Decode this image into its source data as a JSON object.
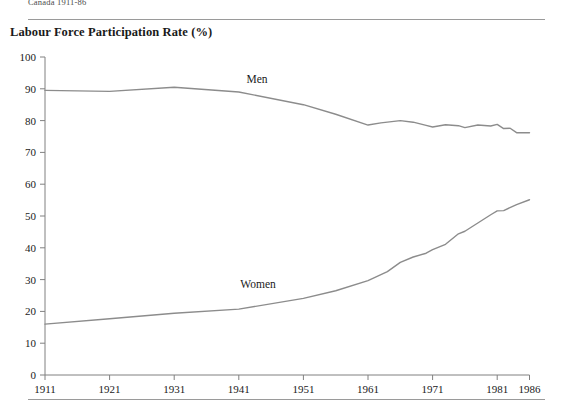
{
  "running_head": "Canada 1911-86",
  "chart_title": "Labour Force Participation Rate (%)",
  "labels": {
    "men": "Men",
    "women": "Women"
  },
  "chart_data": {
    "type": "line",
    "title": "Labour Force Participation Rate (%)",
    "xlabel": "",
    "ylabel": "",
    "xlim": [
      1911,
      1986
    ],
    "ylim": [
      0,
      100
    ],
    "grid": false,
    "legend": "inline-annotations",
    "xticks": [
      "1911",
      "1921",
      "1931",
      "1941",
      "1951",
      "1961",
      "1971",
      "1981",
      "1986"
    ],
    "yticks": [
      "0",
      "10",
      "20",
      "30",
      "40",
      "50",
      "60",
      "70",
      "80",
      "90",
      "100"
    ],
    "series": [
      {
        "name": "Men",
        "color": "#8c8c8c",
        "x": [
          1911,
          1921,
          1931,
          1941,
          1951,
          1956,
          1961,
          1963,
          1966,
          1968,
          1970,
          1971,
          1973,
          1975,
          1976,
          1978,
          1980,
          1981,
          1982,
          1983,
          1984,
          1986
        ],
        "values": [
          89.5,
          89.2,
          90.5,
          89.0,
          85.0,
          82.0,
          78.6,
          79.3,
          80.0,
          79.5,
          78.5,
          78.0,
          78.7,
          78.4,
          77.8,
          78.6,
          78.3,
          78.8,
          77.5,
          77.6,
          76.2,
          76.2
        ]
      },
      {
        "name": "Women",
        "color": "#8c8c8c",
        "x": [
          1911,
          1921,
          1931,
          1941,
          1951,
          1956,
          1961,
          1964,
          1966,
          1968,
          1970,
          1971,
          1973,
          1975,
          1976,
          1978,
          1980,
          1981,
          1982,
          1984,
          1986
        ],
        "values": [
          16.0,
          17.7,
          19.4,
          20.7,
          24.1,
          26.5,
          29.7,
          32.5,
          35.4,
          37.1,
          38.3,
          39.4,
          41.1,
          44.4,
          45.2,
          47.8,
          50.4,
          51.6,
          51.7,
          53.6,
          55.1
        ]
      }
    ]
  }
}
